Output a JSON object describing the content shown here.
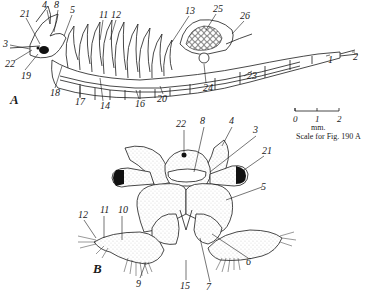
{
  "figure": {
    "panel_a": {
      "label": "A",
      "part_labels": [
        "1",
        "2",
        "3",
        "4",
        "5",
        "8",
        "11",
        "12",
        "13",
        "14",
        "16",
        "17",
        "18",
        "19",
        "20",
        "21",
        "22",
        "23",
        "24",
        "25",
        "26"
      ]
    },
    "panel_b": {
      "label": "B",
      "part_labels": [
        "3",
        "4",
        "5",
        "6",
        "7",
        "8",
        "9",
        "10",
        "11",
        "12",
        "15",
        "21",
        "22"
      ]
    },
    "scale_bar": {
      "ticks": [
        "0",
        "1",
        "2"
      ],
      "unit": "mm.",
      "caption": "Scale for Fig. 190 A"
    }
  }
}
